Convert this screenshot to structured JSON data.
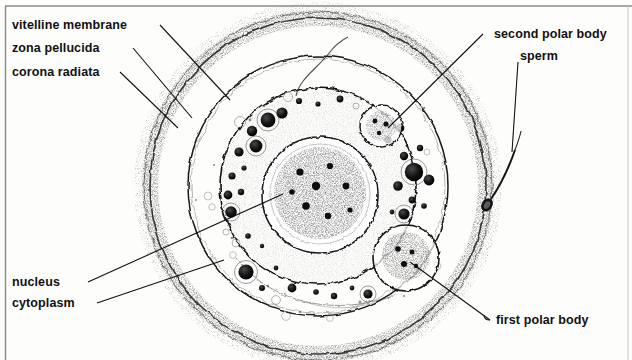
{
  "figure": {
    "type": "labelled-biological-diagram",
    "style": "black-and-white stippled line drawing",
    "background_color": "#fdfdfc",
    "ink_color": "#111111",
    "border_color": "#8a8a8a"
  },
  "labels": {
    "vitelline_membrane": "vitelline membrane",
    "zona_pellucida": "zona pellucida",
    "corona_radiata": "corona radiata",
    "nucleus": "nucleus",
    "cytoplasm": "cytoplasm",
    "second_polar_body": "second polar body",
    "sperm": "sperm",
    "first_polar_body": "first polar body"
  },
  "structures": {
    "corona_radiata": {
      "description": "outermost stippled granulosa cell layer",
      "center": [
        318,
        186
      ],
      "radius": 172
    },
    "zona_pellucida": {
      "description": "middle clear glycoprotein coat",
      "center": [
        318,
        186
      ],
      "radius": 130
    },
    "vitelline_membrane": {
      "description": "inner oolemma enclosing the cytoplasm",
      "center": [
        318,
        186
      ],
      "radius": 98
    },
    "nucleus": {
      "description": "female pronucleus with dense chromatin granules",
      "center": [
        320,
        195
      ],
      "radius": 58
    },
    "second_polar_body": {
      "description": "small polar body at upper right inside vitelline membrane",
      "center": [
        381,
        126
      ],
      "radius": 21
    },
    "first_polar_body": {
      "description": "larger polar body at lower right inside vitelline membrane",
      "center": [
        406,
        258
      ],
      "radius": 33
    },
    "sperm": {
      "description": "spermatozoon with oval head and whip tail in the zona",
      "head": [
        487,
        205
      ],
      "tail_end": [
        505,
        145
      ]
    }
  },
  "leaders": [
    {
      "name": "vitelline-membrane-leader",
      "from": [
        160,
        25
      ],
      "to": [
        230,
        100
      ]
    },
    {
      "name": "zona-pellucida-leader",
      "from": [
        133,
        48
      ],
      "to": [
        192,
        118
      ]
    },
    {
      "name": "corona-radiata-leader",
      "from": [
        120,
        72
      ],
      "to": [
        178,
        128
      ]
    },
    {
      "name": "nucleus-leader",
      "from": [
        88,
        282
      ],
      "to": [
        283,
        194
      ]
    },
    {
      "name": "cytoplasm-leader",
      "from": [
        97,
        303
      ],
      "to": [
        224,
        260
      ]
    },
    {
      "name": "second-polar-body-leader",
      "from": [
        483,
        34
      ],
      "to": [
        388,
        128
      ]
    },
    {
      "name": "sperm-leader",
      "from": [
        518,
        62
      ],
      "to": [
        512,
        152
      ]
    },
    {
      "name": "first-polar-body-leader",
      "from": [
        490,
        320
      ],
      "to": [
        410,
        262
      ]
    }
  ]
}
